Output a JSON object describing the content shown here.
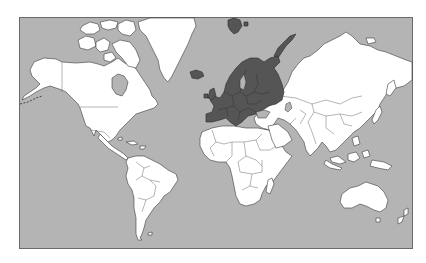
{
  "map": {
    "title": "World map with Europe highlighted",
    "projection": "Mercator",
    "highlighted_region": "Europe",
    "colors": {
      "ocean": "#b4b4b4",
      "land": "#ffffff",
      "highlight": "#555555",
      "frame": "#6a6a6a"
    },
    "regions": [
      {
        "name": "North America",
        "highlighted": false
      },
      {
        "name": "Greenland",
        "highlighted": false
      },
      {
        "name": "South America",
        "highlighted": false
      },
      {
        "name": "Europe",
        "highlighted": true
      },
      {
        "name": "Iceland",
        "highlighted": true
      },
      {
        "name": "Svalbard",
        "highlighted": true
      },
      {
        "name": "Novaya Zemlya",
        "highlighted": true
      },
      {
        "name": "Africa",
        "highlighted": false
      },
      {
        "name": "Asia",
        "highlighted": false
      },
      {
        "name": "Australia",
        "highlighted": false
      },
      {
        "name": "New Zealand",
        "highlighted": false
      }
    ]
  }
}
